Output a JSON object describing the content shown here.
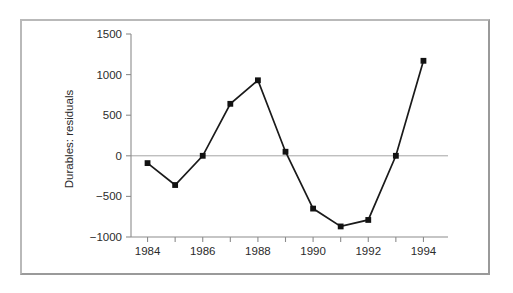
{
  "figure": {
    "frame_color": "#b9b9b9",
    "background": "#ffffff"
  },
  "chart_data": {
    "type": "line",
    "title": "",
    "subtitle": "",
    "xlabel": "",
    "ylabel": "Durables: residuals",
    "x": [
      1984,
      1985,
      1986,
      1987,
      1988,
      1989,
      1990,
      1991,
      1992,
      1993,
      1994
    ],
    "values": [
      -90,
      -360,
      0,
      640,
      930,
      50,
      -650,
      -870,
      -790,
      0,
      1170
    ],
    "series": [
      {
        "name": "Durables: residuals",
        "values": [
          -90,
          -360,
          0,
          640,
          930,
          50,
          -650,
          -870,
          -790,
          0,
          1170
        ],
        "line_color": "#1a1a1a",
        "marker": "square",
        "marker_color": "#121212"
      }
    ],
    "xlim": [
      1983.4,
      1994.6
    ],
    "ylim": [
      -1000,
      1500
    ],
    "xticks": [
      1984,
      1985,
      1986,
      1987,
      1988,
      1989,
      1990,
      1991,
      1992,
      1993,
      1994
    ],
    "xtick_labels": [
      "1984",
      "",
      "1986",
      "",
      "1988",
      "",
      "1990",
      "",
      "1992",
      "",
      "1994"
    ],
    "yticks": [
      -1000,
      -500,
      0,
      500,
      1000,
      1500
    ],
    "ytick_labels": [
      "−1000",
      "−500",
      "0",
      "500",
      "1000",
      "1500"
    ],
    "grid": false,
    "zero_line": true,
    "legend": null,
    "legend_position": "none",
    "annotations": []
  }
}
